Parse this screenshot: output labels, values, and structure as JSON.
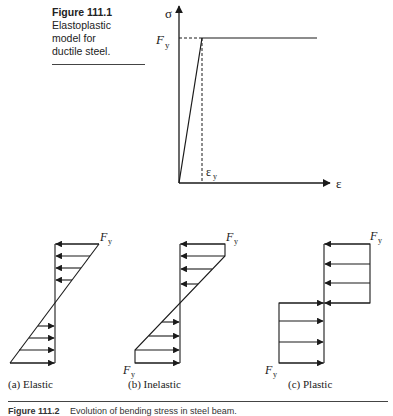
{
  "figure_1": {
    "number": "Figure 111.1",
    "caption": "Elastoplastic model for ductile steel.",
    "caption_lines": [
      "Elastoplastic",
      "model for",
      "ductile steel."
    ],
    "graph": {
      "y_axis_label": "σ",
      "x_axis_label": "ε",
      "yield_stress_label": "F",
      "yield_stress_subscript": "y",
      "yield_strain_label": "ε",
      "yield_strain_subscript": "y",
      "segments": [
        {
          "name": "elastic",
          "from": [
            "0",
            "0"
          ],
          "to": [
            "εy",
            "Fy"
          ]
        },
        {
          "name": "plastic-plateau",
          "from": [
            "εy",
            "Fy"
          ],
          "to": [
            "beyond",
            "Fy"
          ]
        }
      ]
    }
  },
  "figure_2": {
    "number": "Figure 111.2",
    "caption": "Evolution of bending stress in steel beam.",
    "panels": [
      {
        "id": "a",
        "label": "(a) Elastic",
        "stress_label": "F",
        "stress_sub": "y",
        "distribution": "linear"
      },
      {
        "id": "b",
        "label": "(b) Inelastic",
        "stress_label": "F",
        "stress_sub": "y",
        "distribution": "partially-plastic"
      },
      {
        "id": "c",
        "label": "(c) Plastic",
        "stress_label": "F",
        "stress_sub": "y",
        "distribution": "fully-plastic"
      }
    ]
  },
  "colors": {
    "ink": "#1a1a1a",
    "background": "#ffffff"
  }
}
